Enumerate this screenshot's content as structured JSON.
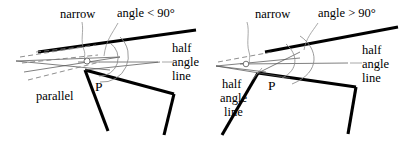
{
  "figure": {
    "type": "geometry-diagram-pair",
    "background_color": "#ffffff",
    "line_color": "#000000",
    "construction_line_color": "#777777",
    "panels": [
      {
        "id": "left",
        "vertex_label": "P",
        "labels": {
          "narrow": "narrow",
          "angle_condition": "angle < 90°",
          "half_angle_line": "half\nangle\nline",
          "half_angle_line_1": "half",
          "half_angle_line_2": "angle",
          "half_angle_line_3": "line",
          "parallel": "parallel"
        }
      },
      {
        "id": "right",
        "vertex_label": "P",
        "labels": {
          "narrow": "narrow",
          "angle_condition": "angle > 90°",
          "half_angle_line_right_1": "half",
          "half_angle_line_right_2": "angle",
          "half_angle_line_right_3": "line",
          "half_angle_line_left_1": "half",
          "half_angle_line_left_2": "angle",
          "half_angle_line_left_3": "line"
        }
      }
    ]
  }
}
